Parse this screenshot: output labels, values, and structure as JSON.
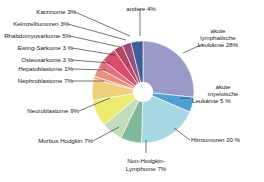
{
  "chart_data": {
    "type": "pie",
    "title": "",
    "subtitle": "",
    "xlabel": "",
    "ylabel": "",
    "legend_position": "labels-with-leader-lines",
    "grid": false,
    "donut": true,
    "donut_hole_ratio": 0.2,
    "start_angle_deg": -90,
    "direction": "clockwise",
    "categories": [
      "akute lymphatische Leukämie",
      "akute myeloische Leukämie",
      "Hirntumoren",
      "Non-Hodgkin-Lymphome",
      "Morbus Hodgkin",
      "Neuroblastome",
      "Nephroblastome",
      "Hepatoblastome",
      "Osteosarkome",
      "Ewing-Sarkome",
      "Rhabdomyosarkome",
      "Keimzelltumoren",
      "Karzinome",
      "andere"
    ],
    "values": [
      28,
      5,
      20,
      7,
      7,
      9,
      7,
      1,
      3,
      3,
      5,
      3,
      3,
      4
    ],
    "value_unit": "%",
    "colors": [
      "#9a9ac8",
      "#4e9fd4",
      "#a8d8e4",
      "#7fb89a",
      "#c2ddb9",
      "#ecea70",
      "#f0cf7c",
      "#f3a97e",
      "#ea8d7e",
      "#e2717f",
      "#d94e6e",
      "#b8455f",
      "#9e4a7a",
      "#3f5f9c"
    ]
  },
  "labels": [
    {
      "id": "karzinome",
      "text": "Karzinome 3%"
    },
    {
      "id": "andere",
      "text": "andere 4%"
    },
    {
      "id": "keimzelltumoren",
      "text": "Keimzelltumoren 3%"
    },
    {
      "id": "rhabdomyosarkome",
      "text": "Rhabdomyosarkome 5%"
    },
    {
      "id": "ewing-sarkome",
      "text": "Ewing-Sarkome 3 %"
    },
    {
      "id": "osteosarkome",
      "text": "Osteosarkome 3 %"
    },
    {
      "id": "hepatoblastome",
      "text": "Hepatoblastome 1%"
    },
    {
      "id": "nephroblastome",
      "text": "Nephroblastome 7%"
    },
    {
      "id": "neuroblastome",
      "text": "Neuroblastome 9%"
    },
    {
      "id": "morbus-hodgkin",
      "text": "Morbus Hodgkin 7%"
    },
    {
      "id": "all-line1",
      "text": "akute"
    },
    {
      "id": "all-line2",
      "text": "lymphatische"
    },
    {
      "id": "all-line3",
      "text": "Leukämie 28%"
    },
    {
      "id": "aml-line1",
      "text": "akute"
    },
    {
      "id": "aml-line2",
      "text": "myeloische"
    },
    {
      "id": "aml-line3",
      "text": "Leukämie 5 %"
    },
    {
      "id": "hirntumoren",
      "text": "Hirntumoren 20 %"
    },
    {
      "id": "nhl-line1",
      "text": "Non-Hodgkin-"
    },
    {
      "id": "nhl-line2",
      "text": "Lymphome 7%"
    }
  ],
  "style": {
    "background": "#ffffff",
    "text_color": "#1b1b1b",
    "leader_line_color": "#3a3a3a",
    "slice_edge_color": "#ffffff",
    "hole_color": "#ffffff"
  }
}
